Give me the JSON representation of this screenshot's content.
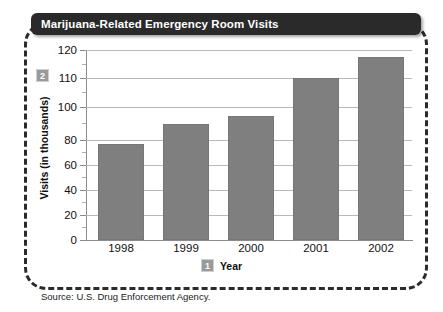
{
  "figure": {
    "title": "Marijuana-Related Emergency Room Visits",
    "source_note": "Source: U.S. Drug Enforcement Agency.",
    "callout_axis_badge": "2",
    "callout_xtitle_badge": "1"
  },
  "chart_data": {
    "type": "bar",
    "title": "Marijuana-Related Emergency Room Visits",
    "xlabel": "Year",
    "ylabel": "Visits (in thousands)",
    "categories": [
      "1998",
      "1999",
      "2000",
      "2001",
      "2002"
    ],
    "values": [
      76,
      86,
      93,
      110,
      117
    ],
    "ytick_labels": [
      "0",
      "20",
      "40",
      "60",
      "80",
      "100",
      "110",
      "120"
    ],
    "ytick_values": [
      0,
      20,
      40,
      60,
      80,
      100,
      110,
      120
    ],
    "ylim": [
      0,
      120
    ],
    "axis_note": "Vertical axis spacing is irregular: 0-80 is evenly spaced, 80-100-110-120 are compressed/expanded",
    "grid": true,
    "legend": "none",
    "bar_color": "#7f7f7f",
    "gridline_color": "#b9b9b9",
    "axis_color": "#8c8c8c"
  },
  "ticks": {
    "y": [
      {
        "label": "120",
        "value": 120,
        "y_px": 0
      },
      {
        "label": "110",
        "value": 110,
        "y_px": 28
      },
      {
        "label": "100",
        "value": 100,
        "y_px": 57
      },
      {
        "label": "80",
        "value": 80,
        "y_px": 90
      },
      {
        "label": "60",
        "value": 60,
        "y_px": 115
      },
      {
        "label": "40",
        "value": 40,
        "y_px": 140
      },
      {
        "label": "20",
        "value": 20,
        "y_px": 165
      },
      {
        "label": "0",
        "value": 0,
        "y_px": 190
      }
    ],
    "y_minor_px": [
      14,
      42,
      73,
      102,
      127,
      152,
      177
    ],
    "gridlines_px": [
      0,
      28,
      57,
      90,
      115,
      140,
      165
    ],
    "bars_px": [
      {
        "label": "1998",
        "value": 76,
        "left": 12,
        "top": 94,
        "center": 35
      },
      {
        "label": "1999",
        "value": 86,
        "left": 77,
        "top": 74,
        "center": 100
      },
      {
        "label": "2000",
        "value": 93,
        "left": 142,
        "top": 66,
        "center": 165
      },
      {
        "label": "2001",
        "value": 110,
        "left": 207,
        "top": 28,
        "center": 230
      },
      {
        "label": "2002",
        "value": 117,
        "left": 272,
        "top": 7,
        "center": 295
      }
    ]
  }
}
